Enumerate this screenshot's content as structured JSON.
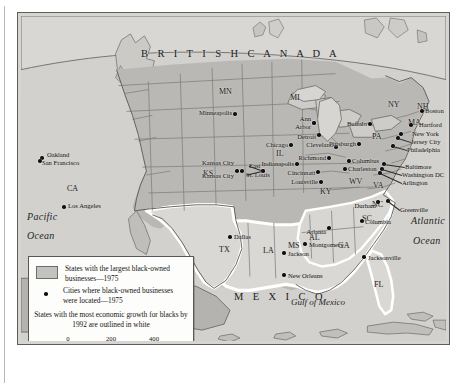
{
  "map": {
    "labels": {
      "country_north": "B R I T I S H   C A N A D A",
      "country_south": "M E X I C O",
      "ocean_west_line1": "Pacific",
      "ocean_west_line2": "Ocean",
      "ocean_east_line1": "Atlantic",
      "ocean_east_line2": "Ocean",
      "gulf": "Gulf of Mexico"
    },
    "states": [
      {
        "abbr": "MN",
        "x": 215,
        "y": 86
      },
      {
        "abbr": "MI",
        "x": 286,
        "y": 92
      },
      {
        "abbr": "NY",
        "x": 384,
        "y": 99
      },
      {
        "abbr": "NH",
        "x": 413,
        "y": 101
      },
      {
        "abbr": "MA",
        "x": 404,
        "y": 117
      },
      {
        "abbr": "PA",
        "x": 368,
        "y": 131
      },
      {
        "abbr": "IL",
        "x": 272,
        "y": 148
      },
      {
        "abbr": "KS",
        "x": 199,
        "y": 168
      },
      {
        "abbr": "CA",
        "x": 63,
        "y": 183
      },
      {
        "abbr": "WV",
        "x": 345,
        "y": 176
      },
      {
        "abbr": "VA",
        "x": 369,
        "y": 180
      },
      {
        "abbr": "KY",
        "x": 316,
        "y": 186
      },
      {
        "abbr": "NC",
        "x": 368,
        "y": 199
      },
      {
        "abbr": "SC",
        "x": 358,
        "y": 213
      },
      {
        "abbr": "TX",
        "x": 215,
        "y": 244
      },
      {
        "abbr": "LA",
        "x": 259,
        "y": 245
      },
      {
        "abbr": "MS",
        "x": 284,
        "y": 240
      },
      {
        "abbr": "AL",
        "x": 305,
        "y": 232
      },
      {
        "abbr": "GA",
        "x": 334,
        "y": 240
      },
      {
        "abbr": "FL",
        "x": 370,
        "y": 279
      }
    ],
    "cities": [
      {
        "name": "Oakland",
        "dx": 41,
        "dy": 157,
        "lx": 46,
        "ly": 154,
        "anchor": "left"
      },
      {
        "name": "San Francisco",
        "dx": 39,
        "dy": 160,
        "lx": 41,
        "ly": 162,
        "anchor": "left"
      },
      {
        "name": "Los Angeles",
        "dx": 63,
        "dy": 206,
        "lx": 67,
        "ly": 205,
        "anchor": "left"
      },
      {
        "name": "Minneapolis",
        "dx": 234,
        "dy": 113,
        "lx": 231,
        "ly": 112,
        "anchor": "right"
      },
      {
        "name": "Kansas City",
        "dx": 236,
        "dy": 170,
        "lx": 233,
        "ly": 162,
        "anchor": "right"
      },
      {
        "name": "Kansas City",
        "dx": 241,
        "dy": 170,
        "lx": 233,
        "ly": 175,
        "anchor": "right"
      },
      {
        "name": "East",
        "dx": 262,
        "dy": 170,
        "lx": 248,
        "ly": 165,
        "anchor": "left"
      },
      {
        "name": "St. Louis",
        "dx": 262,
        "dy": 170,
        "lx": 245,
        "ly": 174,
        "anchor": "left"
      },
      {
        "name": "Chicago",
        "dx": 290,
        "dy": 144,
        "lx": 287,
        "ly": 144,
        "anchor": "right"
      },
      {
        "name": "Ann",
        "dx": 313,
        "dy": 122,
        "lx": 310,
        "ly": 118,
        "anchor": "right"
      },
      {
        "name": "Arbor",
        "dx": 313,
        "dy": 122,
        "lx": 310,
        "ly": 126,
        "anchor": "right"
      },
      {
        "name": "Detroit",
        "dx": 318,
        "dy": 134,
        "lx": 315,
        "ly": 136,
        "anchor": "right"
      },
      {
        "name": "Indianapolis",
        "dx": 296,
        "dy": 163,
        "lx": 293,
        "ly": 163,
        "anchor": "right"
      },
      {
        "name": "Cincinnati",
        "dx": 317,
        "dy": 171,
        "lx": 314,
        "ly": 172,
        "anchor": "right"
      },
      {
        "name": "Louisville",
        "dx": 320,
        "dy": 181,
        "lx": 317,
        "ly": 181,
        "anchor": "right"
      },
      {
        "name": "Cleveland",
        "dx": 335,
        "dy": 146,
        "lx": 332,
        "ly": 144,
        "anchor": "right"
      },
      {
        "name": "Richmond",
        "dx": 328,
        "dy": 157,
        "lx": 325,
        "ly": 157,
        "anchor": "right"
      },
      {
        "name": "Columbus",
        "dx": 348,
        "dy": 160,
        "lx": 351,
        "ly": 160,
        "anchor": "left"
      },
      {
        "name": "Charleston",
        "dx": 344,
        "dy": 168,
        "lx": 347,
        "ly": 168,
        "anchor": "left"
      },
      {
        "name": "Buffalo",
        "dx": 369,
        "dy": 123,
        "lx": 366,
        "ly": 123,
        "anchor": "right"
      },
      {
        "name": "Pittsburgh",
        "dx": 358,
        "dy": 143,
        "lx": 355,
        "ly": 143,
        "anchor": "right"
      },
      {
        "name": "Boston",
        "dx": 421,
        "dy": 110,
        "lx": 424,
        "ly": 110,
        "anchor": "left"
      },
      {
        "name": "Hartford",
        "dx": 410,
        "dy": 124,
        "lx": 418,
        "ly": 124,
        "anchor": "left"
      },
      {
        "name": "New York",
        "dx": 400,
        "dy": 133,
        "lx": 411,
        "ly": 133,
        "anchor": "left"
      },
      {
        "name": "Jersey City",
        "dx": 397,
        "dy": 137,
        "lx": 410,
        "ly": 141,
        "anchor": "left"
      },
      {
        "name": "Philadelphia",
        "dx": 392,
        "dy": 145,
        "lx": 406,
        "ly": 149,
        "anchor": "left"
      },
      {
        "name": "Baltimore",
        "dx": 383,
        "dy": 163,
        "lx": 404,
        "ly": 166,
        "anchor": "left"
      },
      {
        "name": "Washington DC",
        "dx": 381,
        "dy": 168,
        "lx": 401,
        "ly": 174,
        "anchor": "left"
      },
      {
        "name": "Arlington",
        "dx": 379,
        "dy": 172,
        "lx": 401,
        "ly": 182,
        "anchor": "left"
      },
      {
        "name": "Durham",
        "dx": 377,
        "dy": 201,
        "lx": 375,
        "ly": 205,
        "anchor": "right"
      },
      {
        "name": "Greenville",
        "dx": 387,
        "dy": 200,
        "lx": 399,
        "ly": 209,
        "anchor": "left"
      },
      {
        "name": "Columbia",
        "dx": 361,
        "dy": 220,
        "lx": 364,
        "ly": 221,
        "anchor": "left"
      },
      {
        "name": "Atlanta",
        "dx": 328,
        "dy": 227,
        "lx": 325,
        "ly": 231,
        "anchor": "right"
      },
      {
        "name": "Montgomery",
        "dx": 304,
        "dy": 243,
        "lx": 308,
        "ly": 244,
        "anchor": "left"
      },
      {
        "name": "Jackson",
        "dx": 283,
        "dy": 252,
        "lx": 287,
        "ly": 253,
        "anchor": "left"
      },
      {
        "name": "New Orleans",
        "dx": 283,
        "dy": 274,
        "lx": 287,
        "ly": 275,
        "anchor": "left"
      },
      {
        "name": "Jacksonville",
        "dx": 363,
        "dy": 256,
        "lx": 367,
        "ly": 257,
        "anchor": "left"
      },
      {
        "name": "Dallas",
        "dx": 229,
        "dy": 236,
        "lx": 233,
        "ly": 236,
        "anchor": "left"
      }
    ],
    "colors": {
      "land_shaded": "#b9b8b4",
      "land_unshaded": "#d9d8d4",
      "water": "#cfcecb",
      "white_outline": "#ffffff",
      "border": "#5d5d5a"
    }
  },
  "legend": {
    "item1": "States with the largest black-owned businesses—1975",
    "item2": "Cities where black-owned businesses were located—1975",
    "note": "States with the most economic growth for blacks by 1992 are outlined in white",
    "scale": {
      "ticks": [
        "0",
        "200",
        "400"
      ],
      "unit": "Miles"
    }
  },
  "caption": ""
}
